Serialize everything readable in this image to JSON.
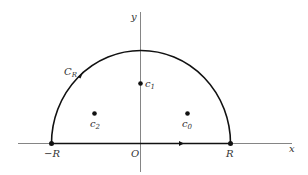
{
  "diagram": {
    "type": "contour-semicircle",
    "axes": {
      "x_label": "x",
      "y_label": "y",
      "origin_label": "O"
    },
    "contour_label": "C",
    "contour_label_sub": "R",
    "endpoints": {
      "left": "−R",
      "right": "R"
    },
    "points": [
      {
        "name": "c",
        "sub": "1"
      },
      {
        "name": "c",
        "sub": "2"
      },
      {
        "name": "c",
        "sub": "0"
      }
    ],
    "colors": {
      "stroke": "#111111",
      "axis": "#555555",
      "text": "#333333"
    }
  }
}
